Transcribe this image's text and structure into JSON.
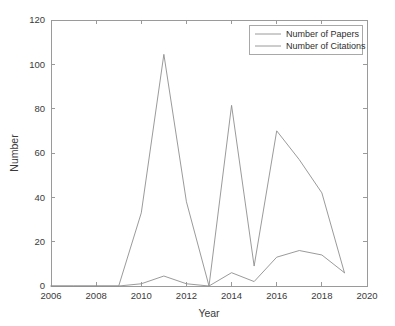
{
  "chart_data": {
    "type": "line",
    "title": "",
    "xlabel": "Year",
    "ylabel": "Number",
    "xlim": [
      2006,
      2020
    ],
    "ylim": [
      0,
      120
    ],
    "xticks": [
      2006,
      2008,
      2010,
      2012,
      2014,
      2016,
      2018,
      2020
    ],
    "xtick_labels": [
      "2006",
      "2008",
      "2010",
      "2012",
      "2014",
      "2016",
      "2018",
      "2020"
    ],
    "yticks": [
      0,
      20,
      40,
      60,
      80,
      100,
      120
    ],
    "ytick_labels": [
      "0",
      "20",
      "40",
      "60",
      "80",
      "100",
      "120"
    ],
    "grid": false,
    "legend_position": "top-right",
    "x": [
      2006,
      2007,
      2008,
      2009,
      2010,
      2011,
      2012,
      2013,
      2014,
      2015,
      2016,
      2017,
      2018,
      2019
    ],
    "series": [
      {
        "name": "Number of Papers",
        "color": "#8f8f8f",
        "values": [
          0,
          0,
          0,
          0,
          1,
          4.5,
          1,
          0,
          6,
          2,
          13,
          16,
          14,
          6
        ]
      },
      {
        "name": "Number of Citations",
        "color": "#8f8f8f",
        "values": [
          0,
          0,
          0,
          0,
          33,
          104.5,
          38,
          0,
          81.5,
          9,
          70,
          57,
          42,
          6
        ]
      }
    ]
  },
  "legend": {
    "entries": [
      {
        "label": "Number of Papers"
      },
      {
        "label": "Number of Citations"
      }
    ]
  },
  "axes": {
    "x_title": "Year",
    "y_title": "Number"
  }
}
